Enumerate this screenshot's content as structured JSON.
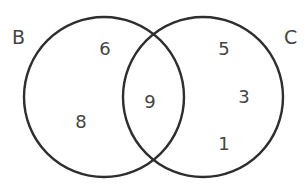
{
  "diagram": {
    "type": "venn",
    "colors": {
      "stroke": "#2e2e2e",
      "text": "#444444",
      "background": "#ffffff"
    },
    "sets": [
      {
        "id": "B",
        "label": "B",
        "cx": 104,
        "cy": 97,
        "r": 80,
        "label_x": 12,
        "label_y": 44
      },
      {
        "id": "C",
        "label": "C",
        "cx": 203,
        "cy": 97,
        "r": 80,
        "label_x": 284,
        "label_y": 44
      }
    ],
    "regions": {
      "B_only": [
        {
          "value": "6",
          "x": 105,
          "y": 55
        },
        {
          "value": "8",
          "x": 81,
          "y": 128
        }
      ],
      "B_and_C": [
        {
          "value": "9",
          "x": 150,
          "y": 108
        }
      ],
      "C_only": [
        {
          "value": "5",
          "x": 224,
          "y": 55
        },
        {
          "value": "3",
          "x": 244,
          "y": 103
        },
        {
          "value": "1",
          "x": 224,
          "y": 150
        }
      ]
    }
  }
}
